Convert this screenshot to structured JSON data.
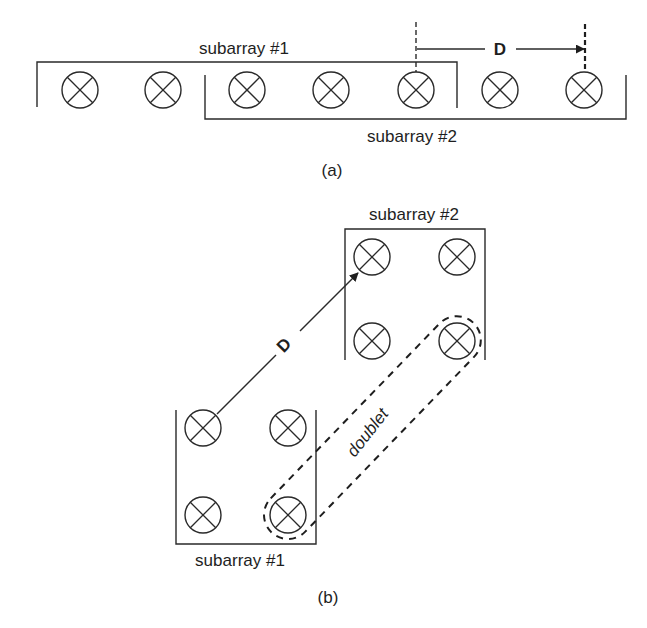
{
  "figure_a": {
    "caption": "(a)",
    "subarray1_label": "subarray #1",
    "subarray2_label": "subarray #2",
    "spacing_label": "D",
    "element_radius": 18,
    "elements": [
      {
        "x": 80,
        "y": 90
      },
      {
        "x": 163,
        "y": 90
      },
      {
        "x": 247,
        "y": 90
      },
      {
        "x": 331,
        "y": 90
      },
      {
        "x": 416,
        "y": 90
      },
      {
        "x": 500,
        "y": 90
      },
      {
        "x": 584,
        "y": 90
      }
    ]
  },
  "figure_b": {
    "caption": "(b)",
    "subarray1_label": "subarray #1",
    "subarray2_label": "subarray #2",
    "spacing_label": "D",
    "doublet_label": "doublet",
    "element_radius": 18,
    "subarray1_elements": [
      {
        "x": 203,
        "y": 428
      },
      {
        "x": 288,
        "y": 428
      },
      {
        "x": 203,
        "y": 515
      },
      {
        "x": 288,
        "y": 515
      }
    ],
    "subarray2_elements": [
      {
        "x": 372,
        "y": 257
      },
      {
        "x": 457,
        "y": 257
      },
      {
        "x": 372,
        "y": 341
      },
      {
        "x": 457,
        "y": 341
      }
    ]
  },
  "colors": {
    "line": "#2a2a2a",
    "text": "#1e1e1e",
    "background": "#ffffff"
  }
}
